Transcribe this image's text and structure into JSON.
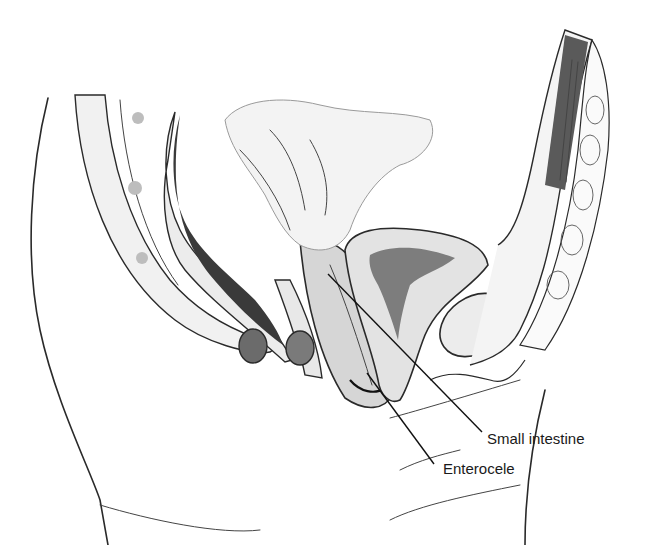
{
  "figure": {
    "labels": [
      {
        "id": "small-intestine",
        "text": "Small intestine"
      },
      {
        "id": "enterocele",
        "text": "Enterocele"
      }
    ],
    "colors": {
      "background": "#ffffff",
      "ink": "#2a2a2a",
      "tissue_light": "#ececec",
      "tissue_mid": "#c9c9c9",
      "tissue_dark": "#3a3a3a"
    }
  }
}
